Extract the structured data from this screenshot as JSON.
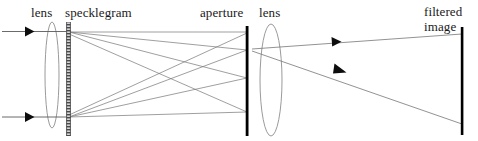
{
  "figure": {
    "kind": "optical-ray-diagram",
    "width": 478,
    "height": 141,
    "background_color": "#ffffff",
    "ink_color": "#000000",
    "ray_color": "#6e6e6e"
  },
  "labels": {
    "lens_input": "lens",
    "specklegram": "specklegram",
    "aperture": "aperture",
    "lens_output": "lens",
    "filtered_image_line1": "filtered",
    "filtered_image_line2": "image"
  },
  "components": [
    {
      "id": "input-lens",
      "name": "lens",
      "shape": "thin-ellipse",
      "cx": 52,
      "cy": 75,
      "rx": 7,
      "ry": 53,
      "color": "#8c8c8c"
    },
    {
      "id": "specklegram",
      "name": "specklegram",
      "shape": "hatched-bar",
      "x": 68,
      "y_top": 22,
      "y_bottom": 136,
      "width": 4,
      "color": "#555555"
    },
    {
      "id": "aperture",
      "name": "aperture",
      "shape": "opaque-bar",
      "x": 247,
      "y_top": 26,
      "y_bottom": 136,
      "width": 3,
      "color": "#000000"
    },
    {
      "id": "output-lens",
      "name": "lens",
      "shape": "thin-ellipse",
      "cx": 271,
      "cy": 80,
      "rx": 11,
      "ry": 56,
      "color": "#8c8c8c"
    },
    {
      "id": "filtered-image-screen",
      "name": "filtered image",
      "shape": "screen-line",
      "x": 462,
      "y_top": 27,
      "y_bottom": 135,
      "width": 3,
      "color": "#000000"
    }
  ],
  "input_beams": [
    {
      "id": "input-ray-upper",
      "x1": 2,
      "y1": 31.5,
      "x2": 68,
      "y2": 31.5,
      "arrow_x": 32,
      "arrow_y": 31.5
    },
    {
      "id": "input-ray-lower",
      "x1": 2,
      "y1": 117,
      "x2": 68,
      "y2": 117,
      "arrow_x": 32,
      "arrow_y": 117
    }
  ],
  "diffracted_rays": [
    {
      "id": "upper-order-0",
      "x1": 69,
      "y1": 32,
      "x2": 247,
      "y2": 32
    },
    {
      "id": "upper-order-+1",
      "x1": 69,
      "y1": 32,
      "x2": 247,
      "y2": 50
    },
    {
      "id": "upper-order-+2",
      "x1": 69,
      "y1": 32,
      "x2": 247,
      "y2": 78
    },
    {
      "id": "upper-order-+3",
      "x1": 69,
      "y1": 34,
      "x2": 247,
      "y2": 112
    },
    {
      "id": "lower-order-0",
      "x1": 69,
      "y1": 117,
      "x2": 247,
      "y2": 112
    },
    {
      "id": "lower-order--1",
      "x1": 69,
      "y1": 117,
      "x2": 247,
      "y2": 78
    },
    {
      "id": "lower-order--2",
      "x1": 69,
      "y1": 117,
      "x2": 247,
      "y2": 50
    },
    {
      "id": "lower-order--3",
      "x1": 69,
      "y1": 115,
      "x2": 247,
      "y2": 33
    }
  ],
  "output_rays": [
    {
      "id": "output-ray-upper",
      "x1": 258,
      "y1": 48,
      "x2": 462,
      "y2": 34,
      "arrow_x": 340,
      "arrow_y": 42,
      "angle_deg": -3.9
    },
    {
      "id": "output-ray-lower",
      "x1": 258,
      "y1": 52,
      "x2": 462,
      "y2": 124,
      "arrow_x": 344,
      "arrow_y": 82,
      "angle_deg": 19.4
    }
  ],
  "label_positions": {
    "lens_input": {
      "x": 31,
      "y": 6
    },
    "specklegram": {
      "x": 65,
      "y": 6
    },
    "aperture": {
      "x": 200,
      "y": 6
    },
    "lens_output": {
      "x": 259,
      "y": 6
    },
    "filtered_image": {
      "x": 424,
      "y": 4
    }
  }
}
